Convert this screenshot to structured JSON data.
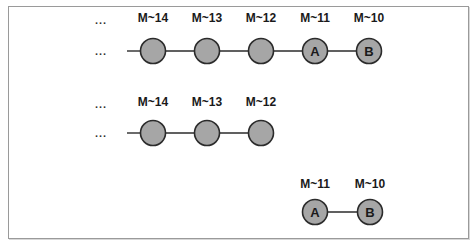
{
  "diagram": {
    "ellipsis": "...",
    "rows": [
      {
        "name": "full-history",
        "label_y": 22,
        "node_y": 51,
        "leading_ellipsis": true,
        "line_start_x": 127,
        "nodes": [
          {
            "x": 153,
            "label": "M~14",
            "text": ""
          },
          {
            "x": 207,
            "label": "M~13",
            "text": ""
          },
          {
            "x": 261,
            "label": "M~12",
            "text": ""
          },
          {
            "x": 315,
            "label": "M~11",
            "text": "A"
          },
          {
            "x": 369,
            "label": "M~10",
            "text": "B"
          }
        ]
      },
      {
        "name": "truncated-history",
        "label_y": 106,
        "node_y": 133,
        "leading_ellipsis": true,
        "line_start_x": 127,
        "nodes": [
          {
            "x": 153,
            "label": "M~14",
            "text": ""
          },
          {
            "x": 207,
            "label": "M~13",
            "text": ""
          },
          {
            "x": 261,
            "label": "M~12",
            "text": ""
          }
        ]
      },
      {
        "name": "split-off-commits",
        "label_y": 188,
        "node_y": 212,
        "leading_ellipsis": false,
        "line_start_x": null,
        "nodes": [
          {
            "x": 315,
            "label": "M~11",
            "text": "A"
          },
          {
            "x": 370,
            "label": "M~10",
            "text": "B"
          }
        ]
      }
    ]
  },
  "colors": {
    "node_fill": "#a6a6a6",
    "node_stroke": "#2b2b2b",
    "frame": "#9a9a9a"
  }
}
